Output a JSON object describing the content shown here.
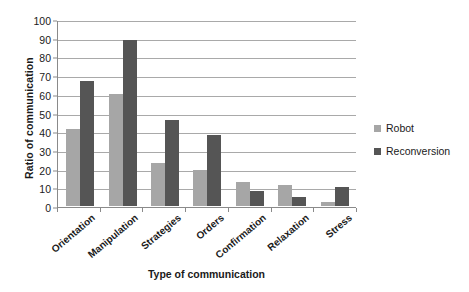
{
  "chart_data": {
    "type": "bar",
    "title": "",
    "xlabel": "Type of communication",
    "ylabel": "Ratio of communication",
    "ylim": [
      0,
      100
    ],
    "ytick_step": 10,
    "yticks": [
      100,
      90,
      80,
      70,
      60,
      50,
      40,
      30,
      20,
      10,
      0
    ],
    "grid": true,
    "legend_position": "right",
    "categories": [
      "Orientation",
      "Manipulation",
      "Strategies",
      "Orders",
      "Confirmation",
      "Relaxation",
      "Stress"
    ],
    "series": [
      {
        "name": "Robot",
        "color": "#a6a6a6",
        "values": [
          41,
          60,
          23,
          19,
          13,
          11,
          2
        ]
      },
      {
        "name": "Reconversion",
        "color": "#555555",
        "values": [
          67,
          89,
          46,
          38,
          8,
          5,
          10
        ]
      }
    ]
  }
}
